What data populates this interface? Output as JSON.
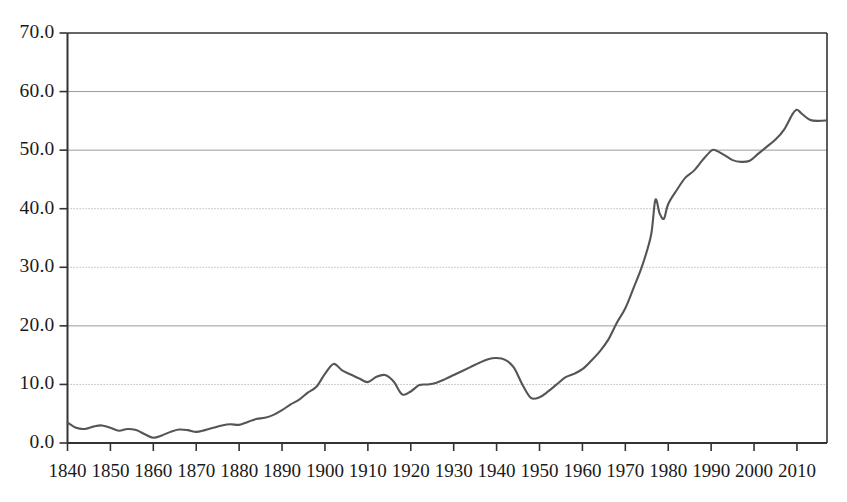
{
  "chart_data": {
    "type": "line",
    "title": "",
    "subtitle": "",
    "xlabel": "",
    "ylabel": "",
    "xlim": [
      1840,
      2017
    ],
    "ylim": [
      0.0,
      70.0
    ],
    "grid": true,
    "legend": null,
    "y_ticks": [
      "0.0",
      "10.0",
      "20.0",
      "30.0",
      "40.0",
      "50.0",
      "60.0",
      "70.0"
    ],
    "y_tick_values": [
      0,
      10,
      20,
      30,
      40,
      50,
      60,
      70
    ],
    "x_ticks": [
      "1840",
      "1850",
      "1860",
      "1870",
      "1880",
      "1890",
      "1900",
      "1910",
      "1920",
      "1930",
      "1940",
      "1950",
      "1960",
      "1970",
      "1980",
      "1990",
      "2000",
      "2010"
    ],
    "x_tick_values": [
      1840,
      1850,
      1860,
      1870,
      1880,
      1890,
      1900,
      1910,
      1920,
      1930,
      1940,
      1950,
      1960,
      1970,
      1980,
      1990,
      2000,
      2010
    ],
    "series": [
      {
        "name": "series-1",
        "color": "#555555",
        "x": [
          1840,
          1842,
          1844,
          1846,
          1848,
          1850,
          1852,
          1854,
          1856,
          1858,
          1860,
          1862,
          1864,
          1866,
          1868,
          1870,
          1872,
          1874,
          1876,
          1878,
          1880,
          1882,
          1884,
          1886,
          1888,
          1890,
          1892,
          1894,
          1896,
          1898,
          1900,
          1902,
          1904,
          1906,
          1908,
          1910,
          1912,
          1914,
          1916,
          1918,
          1920,
          1922,
          1924,
          1926,
          1928,
          1930,
          1932,
          1934,
          1936,
          1938,
          1940,
          1942,
          1944,
          1946,
          1948,
          1950,
          1952,
          1954,
          1956,
          1958,
          1960,
          1962,
          1964,
          1966,
          1968,
          1970,
          1972,
          1974,
          1976,
          1977,
          1978,
          1979,
          1980,
          1982,
          1984,
          1986,
          1988,
          1990,
          1991,
          1993,
          1995,
          1997,
          1999,
          2001,
          2003,
          2005,
          2007,
          2009,
          2010,
          2011,
          2013,
          2015,
          2017
        ],
        "y": [
          3.5,
          2.6,
          2.4,
          2.8,
          3.0,
          2.6,
          2.1,
          2.4,
          2.2,
          1.5,
          0.9,
          1.3,
          1.9,
          2.3,
          2.2,
          1.9,
          2.2,
          2.6,
          3.0,
          3.2,
          3.1,
          3.6,
          4.1,
          4.3,
          4.8,
          5.6,
          6.6,
          7.4,
          8.6,
          9.6,
          11.8,
          13.5,
          12.4,
          11.7,
          11.0,
          10.4,
          11.3,
          11.6,
          10.5,
          8.3,
          8.8,
          9.9,
          10.0,
          10.3,
          10.9,
          11.6,
          12.3,
          13.0,
          13.7,
          14.3,
          14.5,
          14.2,
          12.9,
          10.0,
          7.7,
          7.8,
          8.8,
          10.0,
          11.2,
          11.8,
          12.6,
          14.0,
          15.6,
          17.6,
          20.5,
          23.0,
          26.6,
          30.4,
          35.5,
          41.5,
          39.2,
          38.3,
          40.8,
          43.2,
          45.3,
          46.5,
          48.3,
          49.9,
          50.0,
          49.2,
          48.3,
          48.0,
          48.2,
          49.4,
          50.6,
          51.8,
          53.5,
          56.2,
          56.9,
          56.3,
          55.2,
          55.0,
          55.1
        ]
      }
    ],
    "annotations": []
  },
  "axis_style": {
    "line_color": "#555555",
    "axis_color": "#333333",
    "grid_solid_color": "#9a9a9a",
    "grid_dotted_color": "#aaaaaa",
    "background": "#ffffff"
  }
}
